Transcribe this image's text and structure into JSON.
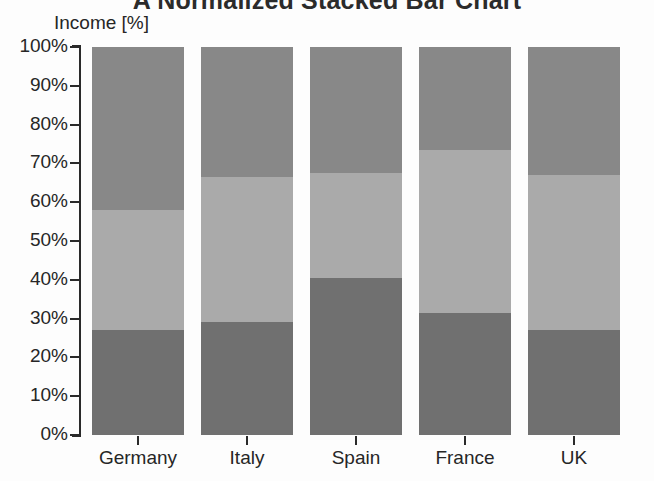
{
  "chart_data": {
    "type": "bar",
    "stacked": true,
    "normalized": true,
    "title": "A Normalized Stacked Bar Chart",
    "xlabel": "",
    "ylabel": "Income [%]",
    "ylim": [
      0,
      100
    ],
    "grid": false,
    "legend": "none",
    "categories": [
      "Germany",
      "Italy",
      "Spain",
      "France",
      "UK"
    ],
    "ytick_labels": [
      "100%",
      "90%",
      "80%",
      "70%",
      "60%",
      "50%",
      "40%",
      "30%",
      "20%",
      "10%",
      "0%"
    ],
    "ytick_values": [
      100,
      90,
      80,
      70,
      60,
      50,
      40,
      30,
      20,
      10,
      0
    ],
    "series": [
      {
        "name": "bottom-segment",
        "color": "#707070",
        "values": [
          27,
          29,
          40.5,
          31.5,
          27
        ]
      },
      {
        "name": "middle-segment",
        "color": "#aaaaaa",
        "values": [
          31,
          37.5,
          27,
          42,
          40
        ]
      },
      {
        "name": "top-segment",
        "color": "#888888",
        "values": [
          42,
          33.5,
          32.5,
          26.5,
          33
        ]
      }
    ]
  },
  "axis": {
    "y_title": "Income [%]",
    "axis_color": "#2a2a2a",
    "label_color": "#262626"
  },
  "title": {
    "text": "A Normalized Stacked Bar Chart",
    "color": "#2b2b2b"
  }
}
